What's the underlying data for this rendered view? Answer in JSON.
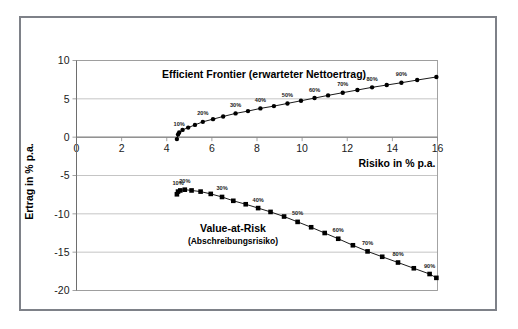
{
  "figure": {
    "background_color": "#ffffff",
    "frame_color": "#7e8188",
    "plot_border_color": "#9a9a9a",
    "gridline_color": "#b6b6b6",
    "series_color": "#000000"
  },
  "axes": {
    "x_title": "Risiko in % p.a.",
    "y_title": "Ertrag in % p.a.",
    "x_ticks": [
      "0",
      "2",
      "4",
      "6",
      "8",
      "10",
      "12",
      "14",
      "16"
    ],
    "y_ticks": [
      "10",
      "5",
      "0",
      "-5",
      "-10",
      "-15",
      "-20"
    ]
  },
  "annotations": {
    "efficient_frontier_title": "Efficient Frontier (erwarteter Nettoertrag)",
    "var_title": "Value-at-Risk",
    "var_subtitle": "(Abschreibungsrisiko)"
  },
  "chart_data": {
    "type": "line",
    "xlabel": "Risiko in % p.a.",
    "ylabel": "Ertrag in % p.a.",
    "xlim": [
      0,
      16
    ],
    "ylim": [
      -20,
      10
    ],
    "x_ticks": [
      0,
      2,
      4,
      6,
      8,
      10,
      12,
      14,
      16
    ],
    "y_ticks": [
      10,
      5,
      0,
      -5,
      -10,
      -15,
      -20
    ],
    "grid": "horizontal",
    "legend": "none",
    "series": [
      {
        "name": "Efficient Frontier (erwarteter Nettoertrag)",
        "marker": "diamond",
        "color": "#000000",
        "points": [
          {
            "x": 4.45,
            "y": -0.25,
            "label": ""
          },
          {
            "x": 4.5,
            "y": 0.35,
            "label": ""
          },
          {
            "x": 4.55,
            "y": 0.6,
            "label": "10%"
          },
          {
            "x": 4.7,
            "y": 0.95,
            "label": ""
          },
          {
            "x": 4.95,
            "y": 1.25,
            "label": ""
          },
          {
            "x": 5.25,
            "y": 1.6,
            "label": ""
          },
          {
            "x": 5.6,
            "y": 2.0,
            "label": "20%"
          },
          {
            "x": 6.05,
            "y": 2.35,
            "label": ""
          },
          {
            "x": 6.5,
            "y": 2.7,
            "label": ""
          },
          {
            "x": 7.05,
            "y": 3.1,
            "label": "30%"
          },
          {
            "x": 7.6,
            "y": 3.4,
            "label": ""
          },
          {
            "x": 8.15,
            "y": 3.75,
            "label": "40%"
          },
          {
            "x": 8.75,
            "y": 4.05,
            "label": ""
          },
          {
            "x": 9.35,
            "y": 4.4,
            "label": "50%"
          },
          {
            "x": 9.95,
            "y": 4.75,
            "label": ""
          },
          {
            "x": 10.55,
            "y": 5.1,
            "label": "60%"
          },
          {
            "x": 11.15,
            "y": 5.45,
            "label": ""
          },
          {
            "x": 11.8,
            "y": 5.8,
            "label": "70%"
          },
          {
            "x": 12.45,
            "y": 6.15,
            "label": ""
          },
          {
            "x": 13.1,
            "y": 6.5,
            "label": "80%"
          },
          {
            "x": 13.75,
            "y": 6.8,
            "label": ""
          },
          {
            "x": 14.4,
            "y": 7.1,
            "label": "90%"
          },
          {
            "x": 15.1,
            "y": 7.45,
            "label": ""
          },
          {
            "x": 15.95,
            "y": 7.85,
            "label": ""
          }
        ]
      },
      {
        "name": "Value-at-Risk (Abschreibungsrisiko)",
        "marker": "square",
        "color": "#000000",
        "points": [
          {
            "x": 4.45,
            "y": -7.45,
            "label": ""
          },
          {
            "x": 4.5,
            "y": -7.1,
            "label": "10%"
          },
          {
            "x": 4.6,
            "y": -6.95,
            "label": ""
          },
          {
            "x": 4.8,
            "y": -6.85,
            "label": "20%"
          },
          {
            "x": 5.1,
            "y": -6.95,
            "label": ""
          },
          {
            "x": 5.5,
            "y": -7.1,
            "label": ""
          },
          {
            "x": 5.95,
            "y": -7.4,
            "label": ""
          },
          {
            "x": 6.45,
            "y": -7.8,
            "label": "30%"
          },
          {
            "x": 6.95,
            "y": -8.3,
            "label": ""
          },
          {
            "x": 7.5,
            "y": -8.75,
            "label": ""
          },
          {
            "x": 8.05,
            "y": -9.25,
            "label": "40%"
          },
          {
            "x": 8.6,
            "y": -9.75,
            "label": ""
          },
          {
            "x": 9.2,
            "y": -10.35,
            "label": ""
          },
          {
            "x": 9.8,
            "y": -11.05,
            "label": "50%"
          },
          {
            "x": 10.4,
            "y": -11.75,
            "label": ""
          },
          {
            "x": 11.0,
            "y": -12.5,
            "label": ""
          },
          {
            "x": 11.6,
            "y": -13.25,
            "label": "60%"
          },
          {
            "x": 12.25,
            "y": -14.1,
            "label": ""
          },
          {
            "x": 12.9,
            "y": -14.9,
            "label": "70%"
          },
          {
            "x": 13.55,
            "y": -15.6,
            "label": ""
          },
          {
            "x": 14.25,
            "y": -16.35,
            "label": "80%"
          },
          {
            "x": 14.95,
            "y": -17.1,
            "label": ""
          },
          {
            "x": 15.65,
            "y": -17.85,
            "label": "90%"
          },
          {
            "x": 15.95,
            "y": -18.35,
            "label": ""
          }
        ]
      }
    ]
  }
}
